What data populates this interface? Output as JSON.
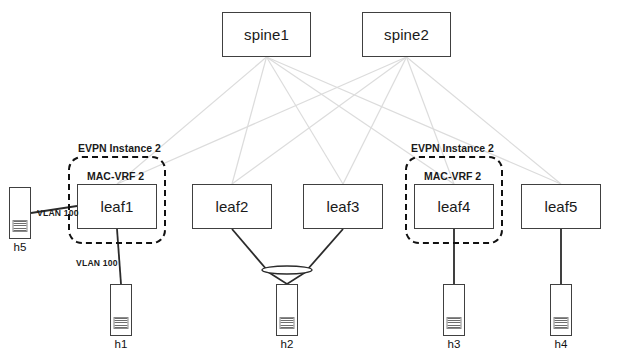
{
  "diagram": {
    "colors": {
      "fabric_link": "#dcdcdc",
      "access_link": "#2b2b2b",
      "node_border": "#404040",
      "evpn_border": "#111111",
      "background": "#ffffff"
    },
    "spines": [
      {
        "id": "spine1",
        "label": "spine1",
        "x": 222,
        "y": 12,
        "w": 89,
        "h": 45
      },
      {
        "id": "spine2",
        "label": "spine2",
        "x": 362,
        "y": 12,
        "w": 89,
        "h": 45
      }
    ],
    "leaves": [
      {
        "id": "leaf1",
        "label": "leaf1",
        "x": 77,
        "y": 184,
        "w": 80,
        "h": 45
      },
      {
        "id": "leaf2",
        "label": "leaf2",
        "x": 192,
        "y": 184,
        "w": 80,
        "h": 45
      },
      {
        "id": "leaf3",
        "label": "leaf3",
        "x": 303,
        "y": 184,
        "w": 80,
        "h": 45
      },
      {
        "id": "leaf4",
        "label": "leaf4",
        "x": 414,
        "y": 184,
        "w": 80,
        "h": 45
      },
      {
        "id": "leaf5",
        "label": "leaf5",
        "x": 521,
        "y": 184,
        "w": 80,
        "h": 45
      }
    ],
    "evpn_instances": [
      {
        "id": "evpn-left",
        "title": "EVPN Instance 2",
        "vrf": "MAC-VRF 2",
        "x": 68,
        "y": 156,
        "w": 98,
        "h": 88,
        "title_x": 78,
        "title_y": 142,
        "vrf_x": 87,
        "vrf_y": 170
      },
      {
        "id": "evpn-right",
        "title": "EVPN Instance 2",
        "vrf": "MAC-VRF 2",
        "x": 405,
        "y": 156,
        "w": 98,
        "h": 88,
        "title_x": 411,
        "title_y": 142,
        "vrf_x": 424,
        "vrf_y": 170
      }
    ],
    "hosts": [
      {
        "id": "h5",
        "label": "h5",
        "x": 9,
        "y": 187,
        "w": 22,
        "h": 52,
        "label_y": 241
      },
      {
        "id": "h1",
        "label": "h1",
        "x": 110,
        "y": 284,
        "w": 22,
        "h": 52,
        "label_y": 338
      },
      {
        "id": "h2",
        "label": "h2",
        "x": 276,
        "y": 284,
        "w": 22,
        "h": 52,
        "label_y": 338
      },
      {
        "id": "h3",
        "label": "h3",
        "x": 443,
        "y": 284,
        "w": 22,
        "h": 52,
        "label_y": 338
      },
      {
        "id": "h4",
        "label": "h4",
        "x": 550,
        "y": 284,
        "w": 22,
        "h": 52,
        "label_y": 338
      }
    ],
    "vlan_labels": [
      {
        "id": "vlan-h5-leaf1",
        "text": "VLAN 100",
        "x": 37,
        "y": 208
      },
      {
        "id": "vlan-leaf1-h1",
        "text": "VLAN 100",
        "x": 76,
        "y": 258
      }
    ],
    "fabric_links": [
      {
        "from": "spine1",
        "to": "leaf1"
      },
      {
        "from": "spine1",
        "to": "leaf2"
      },
      {
        "from": "spine1",
        "to": "leaf3"
      },
      {
        "from": "spine1",
        "to": "leaf4"
      },
      {
        "from": "spine1",
        "to": "leaf5"
      },
      {
        "from": "spine2",
        "to": "leaf1"
      },
      {
        "from": "spine2",
        "to": "leaf2"
      },
      {
        "from": "spine2",
        "to": "leaf3"
      },
      {
        "from": "spine2",
        "to": "leaf4"
      },
      {
        "from": "spine2",
        "to": "leaf5"
      }
    ],
    "access_links": [
      {
        "from": "h5",
        "to": "leaf1",
        "vlan": "VLAN 100"
      },
      {
        "from": "leaf1",
        "to": "h1",
        "vlan": "VLAN 100"
      },
      {
        "from": "leaf2",
        "to": "h2",
        "lag": true
      },
      {
        "from": "leaf3",
        "to": "h2",
        "lag": true
      },
      {
        "from": "leaf4",
        "to": "h3"
      },
      {
        "from": "leaf5",
        "to": "h4"
      }
    ],
    "lag_symbol": {
      "id": "lag-h2",
      "cx": 287,
      "cy": 270,
      "rx": 25,
      "ry": 4
    }
  }
}
